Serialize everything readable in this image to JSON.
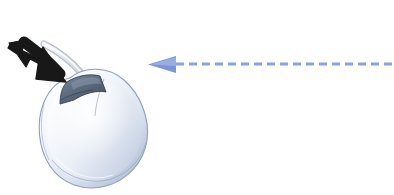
{
  "illustration": {
    "title": "Computer mouse with click-direction arrow",
    "background_color": "#ffffff",
    "canvas": {
      "width": 394,
      "height": 195
    }
  },
  "mouse": {
    "label": "computer-mouse",
    "body_color": "#e9edf5",
    "body_shadow_color": "#9fb0cf",
    "body_highlight_color": "#fdfdff",
    "outline_color": "#8f9fbb",
    "button_color": "#5d6c80",
    "button_shade_color": "#45505f",
    "button_highlight_color": "#7b8a9c",
    "cable_color": "#dfe3ea",
    "cable_outline_color": "#b9c0cc",
    "bounds": {
      "x": 34,
      "y": 62,
      "width": 116,
      "height": 128
    }
  },
  "black_arrow": {
    "label": "click-press-arrow",
    "color": "#181818",
    "direction": "down-right",
    "points_to": "mouse-left-button",
    "bounds": {
      "x": 6,
      "y": 40,
      "width": 62,
      "height": 48
    }
  },
  "blue_arrow": {
    "label": "motion-direction-arrow",
    "color": "#7b96d8",
    "line_color": "#8aa3de",
    "direction": "left",
    "style": "dashed",
    "dash_length": 8,
    "dash_gap": 5,
    "line_width": 3,
    "head": {
      "x": 148,
      "y": 56,
      "width": 28,
      "height": 17
    },
    "line": {
      "x1": 176,
      "x2": 394,
      "y": 64
    }
  }
}
